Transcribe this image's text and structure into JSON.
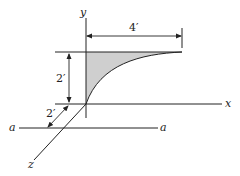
{
  "figure": {
    "axes": {
      "x_label": "x",
      "y_label": "y",
      "z_label": "z"
    },
    "reference_axis": {
      "left_label": "a",
      "right_label": "a"
    },
    "dimensions": {
      "width": "4′",
      "height": "2′",
      "offset": "2′"
    },
    "colors": {
      "line": "#222222",
      "shaded_area": "#cfcfcf"
    }
  }
}
